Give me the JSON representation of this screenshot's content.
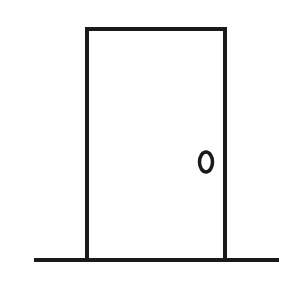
{
  "illustration": {
    "subject": "door",
    "colors": {
      "background": "#ffffff",
      "stroke": "#1a1a1a"
    },
    "door": {
      "x": 87,
      "y": 29,
      "width": 138,
      "height": 231,
      "stroke_width": 4
    },
    "knob": {
      "cx": 206,
      "cy": 162,
      "rx": 6.5,
      "ry": 10,
      "stroke_width": 3.5
    },
    "ground": {
      "x1": 34,
      "x2": 279,
      "y": 260,
      "stroke_width": 4
    }
  }
}
